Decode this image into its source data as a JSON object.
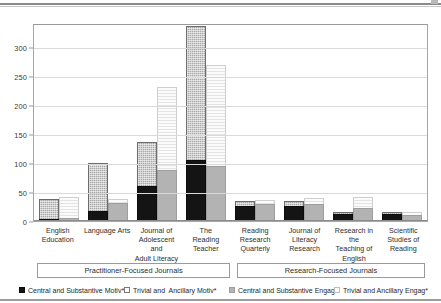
{
  "chart_data": {
    "type": "bar",
    "subtype": "grouped-stacked",
    "title": "",
    "xlabel": "",
    "ylabel": "",
    "ylim": [
      0,
      340
    ],
    "yticks": [
      0,
      50,
      100,
      150,
      200,
      250,
      300
    ],
    "grid": true,
    "legend_position": "bottom",
    "categories": [
      "English Education",
      "Language Arts",
      "Journal of Adolescent and Adult Literacy",
      "The Reading Teacher",
      "Reading Research Quarterly",
      "Journal of Literacy Research",
      "Research in the Teaching of English",
      "Scientific Studies of Reading"
    ],
    "category_lines": [
      [
        "English",
        "Education"
      ],
      [
        "Language Arts"
      ],
      [
        "Journal of",
        "Adolescent and",
        "Adult Literacy"
      ],
      [
        "The",
        "Reading",
        "Teacher"
      ],
      [
        "Reading",
        "Research",
        "Quarterly"
      ],
      [
        "Journal of",
        "Literacy",
        "Research"
      ],
      [
        "Research in the",
        "Teaching of",
        "English"
      ],
      [
        "Scientific",
        "Studies of",
        "Reading"
      ]
    ],
    "series": [
      {
        "name": "Central and Substantive Motiv*",
        "stack": "motivation",
        "swatch": "black-filled",
        "values": [
          1,
          16,
          59,
          103,
          25,
          24,
          11,
          11
        ]
      },
      {
        "name": "Trivial and  Ancillary Motiv*",
        "stack": "motivation",
        "swatch": "white-outline",
        "values": [
          35,
          82,
          75,
          232,
          7,
          8,
          2,
          1
        ]
      },
      {
        "name": "Central and Substantive Engag*",
        "stack": "engagement",
        "swatch": "gray-filled",
        "values": [
          4,
          30,
          87,
          93,
          28,
          27,
          20,
          9
        ]
      },
      {
        "name": "Trivial and Ancillary Engag*",
        "stack": "engagement",
        "swatch": "white-light",
        "values": [
          36,
          6,
          143,
          174,
          7,
          11,
          19,
          5
        ]
      }
    ],
    "stack_totals": {
      "motivation": [
        36,
        98,
        134,
        335,
        32,
        32,
        13,
        12
      ],
      "engagement": [
        40,
        36,
        230,
        267,
        35,
        38,
        39,
        14
      ]
    },
    "groupings": [
      {
        "label": "Practitioner-Focused Journals",
        "count": 4
      },
      {
        "label": "Research-Focused Journals",
        "count": 4
      }
    ]
  }
}
